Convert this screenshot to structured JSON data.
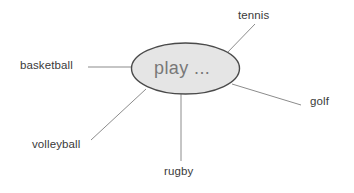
{
  "diagram": {
    "type": "mind-map",
    "title": "play ...",
    "center": {
      "label": "play ...",
      "shape": "ellipse",
      "fill_color": "#e5e5e5",
      "stroke_color": "#4a4a4a",
      "text_color": "#787878",
      "cx": 185.5,
      "cy": 68.5,
      "rx": 54,
      "ry": 25.5
    },
    "background_color": "#ffffff",
    "line_color": "#8c8c8c",
    "label_color": "#3a3a3a",
    "branches": [
      {
        "id": "tennis",
        "label": "tennis",
        "label_x": 238,
        "label_y": 9,
        "line": {
          "x1": 226,
          "y1": 54,
          "x2": 255,
          "y2": 24
        }
      },
      {
        "id": "golf",
        "label": "golf",
        "label_x": 310,
        "label_y": 95,
        "line": {
          "x1": 232,
          "y1": 84,
          "x2": 301,
          "y2": 105
        }
      },
      {
        "id": "rugby",
        "label": "rugby",
        "label_x": 164,
        "label_y": 165,
        "line": {
          "x1": 181,
          "y1": 94,
          "x2": 181,
          "y2": 161
        }
      },
      {
        "id": "volleyball",
        "label": "volleyball",
        "label_x": 32,
        "label_y": 138,
        "line": {
          "x1": 146,
          "y1": 89,
          "x2": 91,
          "y2": 140
        }
      },
      {
        "id": "basketball",
        "label": "basketball",
        "label_x": 20,
        "label_y": 59,
        "line": {
          "x1": 131,
          "y1": 67,
          "x2": 88,
          "y2": 67
        }
      }
    ]
  }
}
